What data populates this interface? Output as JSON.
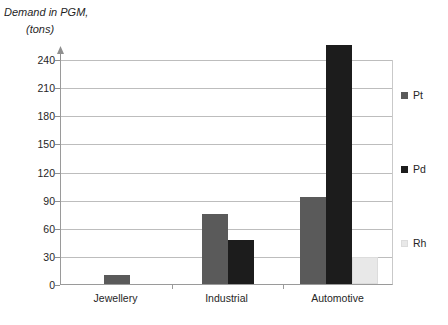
{
  "title": {
    "line1": "Demand in PGM,",
    "line2": "(tons)"
  },
  "legend": {
    "position": "right",
    "entries": [
      {
        "label": "Pt",
        "color": "#5a5a5a"
      },
      {
        "label": "Pd",
        "color": "#1c1c1c"
      },
      {
        "label": "Rh",
        "color": "#e8e8e8"
      }
    ]
  },
  "axis": {
    "y_ticks": [
      "0",
      "30",
      "60",
      "90",
      "120",
      "150",
      "180",
      "210",
      "240"
    ],
    "x_labels": [
      "Jewellery",
      "Industrial",
      "Automotive"
    ]
  },
  "chart_data": {
    "type": "bar",
    "title": "Demand in PGM, (tons)",
    "xlabel": "",
    "ylabel": "Demand in PGM, (tons)",
    "categories": [
      "Jewellery",
      "Industrial",
      "Automotive"
    ],
    "series": [
      {
        "name": "Pt",
        "color": "#5a5a5a",
        "values": [
          10,
          75,
          93
        ]
      },
      {
        "name": "Pd",
        "color": "#1c1c1c",
        "values": [
          0,
          47,
          255
        ]
      },
      {
        "name": "Rh",
        "color": "#e8e8e8",
        "values": [
          0,
          0,
          29
        ]
      }
    ],
    "ylim": [
      0,
      240
    ],
    "ytick_step": 30,
    "yticks": [
      0,
      30,
      60,
      90,
      120,
      150,
      180,
      210,
      240
    ],
    "grid": true,
    "grid_axis": "y",
    "legend_position": "right"
  }
}
